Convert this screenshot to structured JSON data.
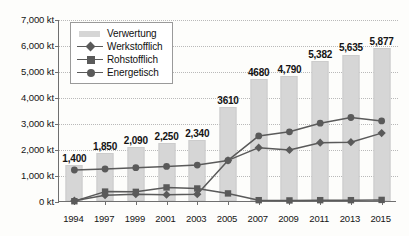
{
  "chart_data": {
    "type": "bar",
    "title": "",
    "xlabel": "",
    "ylabel": "",
    "ylim": [
      0,
      7000
    ],
    "grid": true,
    "legend_position": "top-left",
    "unit": "kt",
    "categories": [
      "1994",
      "1997",
      "1999",
      "2001",
      "2003",
      "2005",
      "2007",
      "2009",
      "2011",
      "2013",
      "2015"
    ],
    "ytick_labels": [
      "7,000 kt",
      "6,000 kt",
      "5,000 kt",
      "4,000 kt",
      "3,000 kt",
      "2,000 kt",
      "1,000 kt",
      "0 kt"
    ],
    "ytick_values": [
      7000,
      6000,
      5000,
      4000,
      3000,
      2000,
      1000,
      0
    ],
    "bar_series": {
      "name": "Verwertung",
      "values": [
        1400,
        1850,
        2090,
        2250,
        2340,
        3610,
        4680,
        4790,
        5382,
        5635,
        5877
      ],
      "data_labels": [
        "1,400",
        "1,850",
        "2,090",
        "2,250",
        "2,340",
        "3610",
        "4680",
        "4,790",
        "5,382",
        "5,635",
        "5,877"
      ],
      "color": "#d6d6d6"
    },
    "series": [
      {
        "name": "Werkstofflich",
        "marker": "diamond",
        "color": "#5a5a5a",
        "values": [
          50,
          260,
          300,
          280,
          300,
          1600,
          2090,
          2000,
          2280,
          2300,
          2650
        ]
      },
      {
        "name": "Rohstofflich",
        "marker": "square",
        "color": "#5a5a5a",
        "values": [
          30,
          400,
          390,
          560,
          520,
          330,
          70,
          60,
          70,
          70,
          80
        ]
      },
      {
        "name": "Energetisch",
        "marker": "circle",
        "color": "#5a5a5a",
        "values": [
          1230,
          1270,
          1320,
          1370,
          1420,
          1600,
          2540,
          2700,
          3030,
          3250,
          3120
        ]
      }
    ]
  },
  "legend": {
    "items": [
      {
        "label": "Verwertung",
        "key": "bar-swatch"
      },
      {
        "label": "Werkstofflich",
        "key": "line-diamond"
      },
      {
        "label": "Rohstofflich",
        "key": "line-square"
      },
      {
        "label": "Energetisch",
        "key": "line-circle"
      }
    ]
  }
}
